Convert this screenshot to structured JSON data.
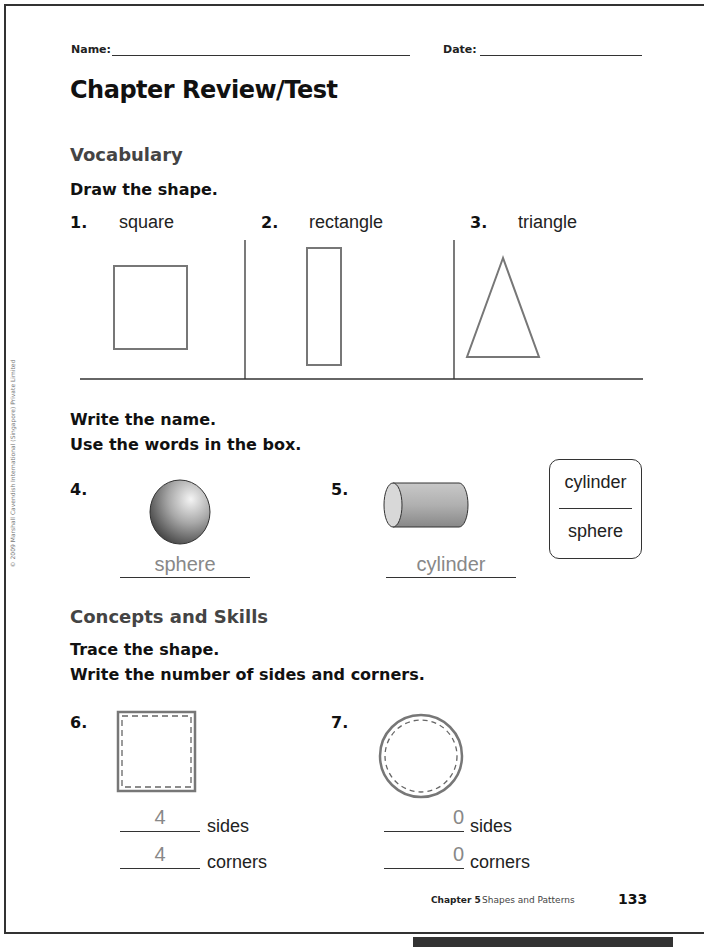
{
  "header": {
    "name_label": "Name:",
    "date_label": "Date:",
    "name_value": "",
    "date_value": ""
  },
  "title": "Chapter Review/Test",
  "copyright": "© 2009 Marshall Cavendish International (Singapore) Private Limited",
  "vocabulary": {
    "heading": "Vocabulary",
    "instruction": "Draw the shape.",
    "items": [
      {
        "number": "1.",
        "word": "square",
        "shape": "square"
      },
      {
        "number": "2.",
        "word": "rectangle",
        "shape": "rectangle"
      },
      {
        "number": "3.",
        "word": "triangle",
        "shape": "triangle"
      }
    ]
  },
  "write_name": {
    "instruction_1": "Write the name.",
    "instruction_2": "Use the words in the box.",
    "items": [
      {
        "number": "4.",
        "image": "sphere-image",
        "answer": "sphere"
      },
      {
        "number": "5.",
        "image": "cylinder-image",
        "answer": "cylinder"
      }
    ],
    "word_box": [
      "cylinder",
      "sphere"
    ]
  },
  "concepts": {
    "heading": "Concepts and Skills",
    "instruction_1": "Trace the shape.",
    "instruction_2": "Write the number of sides and corners.",
    "items": [
      {
        "number": "6.",
        "shape": "square",
        "sides": "4",
        "corners": "4",
        "sides_label": "sides",
        "corners_label": "corners"
      },
      {
        "number": "7.",
        "shape": "circle",
        "sides": "0",
        "corners": "0",
        "sides_label": "sides",
        "corners_label": "corners"
      }
    ]
  },
  "footer": {
    "chapter": "Chapter 5",
    "subtitle": "Shapes and Patterns",
    "page_number": "133"
  }
}
